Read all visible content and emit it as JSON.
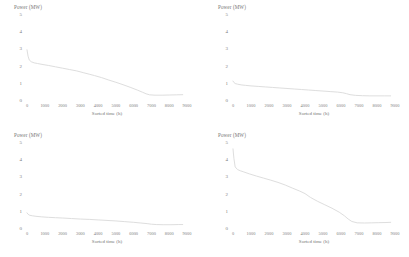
{
  "figure": {
    "background": "#ffffff",
    "line_color": "#dedede",
    "text_color": "#757575",
    "panel_count": 4
  },
  "chart_data": [
    {
      "type": "line",
      "title": "",
      "panel": "top-left",
      "xlabel": "Sorted time (h)",
      "ylabel": "Power (MW)",
      "xlim": [
        0,
        9000
      ],
      "ylim": [
        0,
        5
      ],
      "xticks": [
        0,
        1000,
        2000,
        3000,
        4000,
        5000,
        6000,
        7000,
        8000,
        9000
      ],
      "yticks": [
        0,
        1,
        2,
        3,
        4,
        5
      ],
      "grid": false,
      "legend": "none",
      "series": [
        {
          "name": "Load duration curve",
          "x": [
            0,
            60,
            130,
            250,
            400,
            600,
            900,
            1200,
            1600,
            2000,
            2400,
            2800,
            3200,
            3500,
            3800,
            4200,
            4600,
            5000,
            5400,
            5800,
            6200,
            6500,
            6700,
            6900,
            7200,
            7600,
            8000,
            8400,
            8760
          ],
          "y": [
            2.92,
            2.55,
            2.32,
            2.22,
            2.16,
            2.12,
            2.06,
            2.01,
            1.93,
            1.85,
            1.77,
            1.69,
            1.58,
            1.5,
            1.42,
            1.3,
            1.16,
            1.03,
            0.89,
            0.74,
            0.58,
            0.45,
            0.36,
            0.3,
            0.28,
            0.28,
            0.29,
            0.3,
            0.31
          ]
        }
      ]
    },
    {
      "type": "line",
      "title": "",
      "panel": "top-right",
      "xlabel": "Sorted time (h)",
      "ylabel": "Power (MW)",
      "xlim": [
        0,
        9000
      ],
      "ylim": [
        0,
        5
      ],
      "xticks": [
        0,
        1000,
        2000,
        3000,
        4000,
        5000,
        6000,
        7000,
        8000,
        9000
      ],
      "yticks": [
        0,
        1,
        2,
        3,
        4,
        5
      ],
      "grid": false,
      "legend": "none",
      "series": [
        {
          "name": "Load duration curve",
          "x": [
            0,
            50,
            120,
            250,
            450,
            700,
            1000,
            1400,
            1800,
            2200,
            2600,
            3000,
            3400,
            3800,
            4200,
            4600,
            5000,
            5400,
            5800,
            6100,
            6300,
            6500,
            6800,
            7200,
            7600,
            8000,
            8400,
            8760
          ],
          "y": [
            1.1,
            1.02,
            0.96,
            0.92,
            0.88,
            0.85,
            0.82,
            0.79,
            0.76,
            0.73,
            0.7,
            0.67,
            0.64,
            0.61,
            0.58,
            0.55,
            0.52,
            0.49,
            0.46,
            0.42,
            0.37,
            0.31,
            0.27,
            0.25,
            0.24,
            0.24,
            0.24,
            0.24
          ]
        }
      ]
    },
    {
      "type": "line",
      "title": "",
      "panel": "bottom-left",
      "xlabel": "Sorted time (h)",
      "ylabel": "Power (MW)",
      "xlim": [
        0,
        9000
      ],
      "ylim": [
        0,
        5
      ],
      "xticks": [
        0,
        1000,
        2000,
        3000,
        4000,
        5000,
        6000,
        7000,
        8000,
        9000
      ],
      "yticks": [
        0,
        1,
        2,
        3,
        4,
        5
      ],
      "grid": false,
      "legend": "none",
      "series": [
        {
          "name": "Load duration curve",
          "x": [
            0,
            60,
            150,
            300,
            500,
            800,
            1200,
            1600,
            2000,
            2500,
            3000,
            3500,
            4000,
            4500,
            5000,
            5500,
            6000,
            6400,
            6800,
            7000,
            7300,
            7700,
            8100,
            8500,
            8760
          ],
          "y": [
            0.88,
            0.8,
            0.74,
            0.71,
            0.68,
            0.65,
            0.62,
            0.6,
            0.58,
            0.55,
            0.52,
            0.5,
            0.47,
            0.44,
            0.41,
            0.37,
            0.33,
            0.29,
            0.25,
            0.22,
            0.2,
            0.19,
            0.19,
            0.2,
            0.2
          ]
        }
      ]
    },
    {
      "type": "line",
      "title": "",
      "panel": "bottom-right",
      "xlabel": "Sorted time (h)",
      "ylabel": "Power (MW)",
      "xlim": [
        0,
        9000
      ],
      "ylim": [
        0,
        5
      ],
      "xticks": [
        0,
        1000,
        2000,
        3000,
        4000,
        5000,
        6000,
        7000,
        8000,
        9000
      ],
      "yticks": [
        0,
        1,
        2,
        3,
        4,
        5
      ],
      "grid": false,
      "legend": "none",
      "series": [
        {
          "name": "Load duration curve",
          "x": [
            0,
            50,
            120,
            250,
            400,
            600,
            900,
            1300,
            1700,
            2100,
            2500,
            2900,
            3300,
            3700,
            4000,
            4300,
            4700,
            5100,
            5500,
            5900,
            6200,
            6400,
            6600,
            6900,
            7300,
            7700,
            8100,
            8500,
            8760
          ],
          "y": [
            4.6,
            4.05,
            3.55,
            3.4,
            3.33,
            3.26,
            3.15,
            3.02,
            2.9,
            2.78,
            2.65,
            2.5,
            2.32,
            2.15,
            2.0,
            1.78,
            1.55,
            1.35,
            1.15,
            0.92,
            0.7,
            0.52,
            0.38,
            0.3,
            0.29,
            0.3,
            0.31,
            0.32,
            0.33
          ]
        }
      ]
    }
  ],
  "panels": [
    {
      "ylabel": "Power (MW)",
      "xlabel": "Sorted time (h)",
      "yticks": [
        "5",
        "4",
        "3",
        "2",
        "1",
        "0"
      ],
      "xticks": [
        "0",
        "1000",
        "2000",
        "3000",
        "4000",
        "5000",
        "6000",
        "7000",
        "8000",
        "9000"
      ]
    },
    {
      "ylabel": "Power (MW)",
      "xlabel": "Sorted time (h)",
      "yticks": [
        "5",
        "4",
        "3",
        "2",
        "1",
        "0"
      ],
      "xticks": [
        "0",
        "1000",
        "2000",
        "3000",
        "4000",
        "5000",
        "6000",
        "7000",
        "8000",
        "9000"
      ]
    },
    {
      "ylabel": "Power (MW)",
      "xlabel": "Sorted time (h)",
      "yticks": [
        "5",
        "4",
        "3",
        "2",
        "1",
        "0"
      ],
      "xticks": [
        "0",
        "1000",
        "2000",
        "3000",
        "4000",
        "5000",
        "6000",
        "7000",
        "8000",
        "9000"
      ]
    },
    {
      "ylabel": "Power (MW)",
      "xlabel": "Sorted time (h)",
      "yticks": [
        "5",
        "4",
        "3",
        "2",
        "1",
        "0"
      ],
      "xticks": [
        "0",
        "1000",
        "2000",
        "3000",
        "4000",
        "5000",
        "6000",
        "7000",
        "8000",
        "9000"
      ]
    }
  ]
}
